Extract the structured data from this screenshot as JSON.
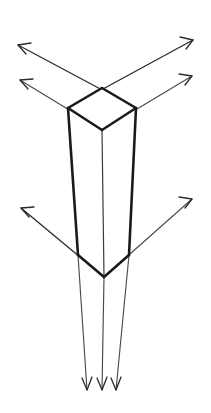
{
  "diagram": {
    "colors": {
      "background": "#ffffff",
      "edge_bold": "#1a1a1a",
      "edge_thin": "#3a3a3a",
      "ray": "#4a4a4a",
      "ray_head": "#2b2b2b",
      "face_fill": "#ffffff"
    },
    "canvas": {
      "width": 211,
      "height": 413
    },
    "prism": {
      "label": "rectangular-prism",
      "top_face": {
        "label": "top-face",
        "points": "102,88 136,108 102,130 68,108"
      },
      "left_face": {
        "label": "left-face",
        "points": "68,108 102,130 104,277 78,255"
      },
      "right_face": {
        "label": "right-face",
        "points": "102,130 136,108 129,255 104,277"
      },
      "edges_bold": [
        "M 102,88 L 136,108",
        "M 102,88 L 68,108",
        "M 68,108 L 102,130",
        "M 136,108 L 102,130",
        "M 68,108 L 78,255",
        "M 136,108 L 129,255",
        "M 78,255 L 104,277",
        "M 129,255 L 104,277"
      ],
      "edges_thin": [
        "M 102,130 L 104,277"
      ]
    },
    "rays": {
      "label": "directional-rays",
      "items": [
        {
          "name": "ray-top-left-upper",
          "direction": "up-left",
          "from": "136,108",
          "to": "18,45",
          "weight": "strong"
        },
        {
          "name": "ray-top-left-lower",
          "direction": "up-left",
          "from": "102,130",
          "to": "20,80",
          "weight": "thin"
        },
        {
          "name": "ray-top-right-upper",
          "direction": "up-right",
          "from": "68,108",
          "to": "193,40",
          "weight": "strong"
        },
        {
          "name": "ray-top-right-lower",
          "direction": "up-right",
          "from": "102,130",
          "to": "192,76",
          "weight": "thin"
        },
        {
          "name": "ray-mid-left",
          "direction": "up-left",
          "from": "104,277",
          "to": "21,208",
          "weight": "strong"
        },
        {
          "name": "ray-mid-right",
          "direction": "up-right",
          "from": "104,277",
          "to": "192,199",
          "weight": "thin"
        },
        {
          "name": "ray-down-left",
          "direction": "down",
          "from": "78,255",
          "to": "87,390",
          "weight": "thin"
        },
        {
          "name": "ray-down-center",
          "direction": "down",
          "from": "104,277",
          "to": "102,390",
          "weight": "thin"
        },
        {
          "name": "ray-down-right",
          "direction": "down",
          "from": "129,255",
          "to": "116,390",
          "weight": "thin"
        }
      ]
    },
    "arrowheads": [
      {
        "name": "arrowhead-top-left-upper",
        "path": "M 31,43 L 18,45 L 26,54"
      },
      {
        "name": "arrowhead-top-left-lower",
        "path": "M 33,79 L 20,80 L 28,89"
      },
      {
        "name": "arrowhead-top-right-upper",
        "path": "M 180,37 L 193,40 L 186,49"
      },
      {
        "name": "arrowhead-top-right-lower",
        "path": "M 179,74 L 192,76 L 185,85"
      },
      {
        "name": "arrowhead-mid-left",
        "path": "M 34,207 L 21,208 L 29,217"
      },
      {
        "name": "arrowhead-mid-right",
        "path": "M 179,197 L 192,199 L 185,208"
      },
      {
        "name": "arrowhead-down-left",
        "path": "M 82,378 L 87,390 L 92,377"
      },
      {
        "name": "arrowhead-down-center",
        "path": "M 97,378 L 102,390 L 107,377"
      },
      {
        "name": "arrowhead-down-right",
        "path": "M 111,378 L 116,390 L 121,377"
      }
    ]
  }
}
